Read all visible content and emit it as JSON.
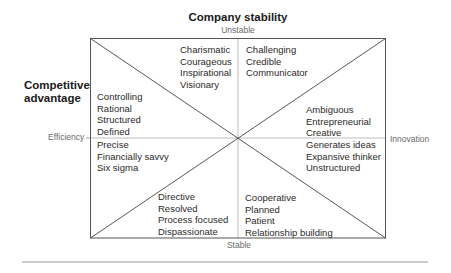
{
  "diagram": {
    "title": "Company stability",
    "side_title_line1": "Competitive",
    "side_title_line2": "advantage",
    "axes": {
      "top": "Unstable",
      "bottom": "Stable",
      "left": "Efficiency",
      "right": "Innovation"
    },
    "colors": {
      "frame": "#555555",
      "diagonal": "#444444",
      "midline": "#b5b5b5",
      "rule": "#999999",
      "text": "#2a2a2a",
      "axis_text": "#6a6a6a"
    },
    "quadrants": {
      "top_left": [
        "Charismatic",
        "Courageous",
        "Inspirational",
        "Visionary"
      ],
      "top_right": [
        "Challenging",
        "Credible",
        "Communicator"
      ],
      "left_upper": [
        "Controlling",
        "Rational",
        "Structured",
        "Defined"
      ],
      "left_lower": [
        "Precise",
        "Financially savvy",
        "Six sigma"
      ],
      "right_upper": [
        "Ambiguous",
        "Entrepreneurial",
        "Creative"
      ],
      "right_lower": [
        "Generates ideas",
        "Expansive thinker",
        "Unstructured"
      ],
      "bottom_left": [
        "Directive",
        "Resolved",
        "Process focused",
        "Dispassionate"
      ],
      "bottom_right": [
        "Cooperative",
        "Planned",
        "Patient",
        "Relationship building"
      ]
    }
  }
}
